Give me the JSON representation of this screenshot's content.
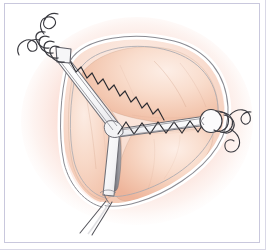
{
  "figure": {
    "title": "Tri-radiate tissue incision with running zigzag suture line",
    "domain_label": "surgical-illustration",
    "background_color": "#ffffff",
    "border_color": "#c9c8dd",
    "shadow_color": "#d9d8e6"
  },
  "palette": {
    "tissue_fill_light": "#fbe3d6",
    "tissue_fill_mid": "#f6cdb8",
    "tissue_fill_deep": "#eeb69c",
    "tissue_glow": "#f4a08a",
    "glow_outer": "#f6b7a4",
    "band_fill": "#ffffff",
    "band_highlight": "#f5f5f7",
    "band_shade": "#e3e3e6",
    "outline": "#6f6f74",
    "outline_soft": "#9a9aa0",
    "suture_thread": "#3a3a40",
    "groove_dark": "#8a8a90",
    "groove_darkest": "#5a5a60"
  },
  "elements": {
    "tissue_mass": {
      "name": "Tissue mass",
      "description": "Rounded triangular organ body, salmon/peach fill with soft red glow at margins"
    },
    "incision": {
      "name": "Tri-radiate incision",
      "arms": 3,
      "arm_labels": [
        "upper-left arm",
        "right arm",
        "lower arm"
      ],
      "center_label": "central junction"
    },
    "suture_line": {
      "name": "Running zigzag suture",
      "stitch_count_upper_left": 11,
      "stitch_count_right": 9,
      "color": "#2c2c31"
    },
    "knot_upper_left": {
      "name": "Upper-left suture knot",
      "loops": 4,
      "tail_count": 2
    },
    "knot_right": {
      "name": "Right suture knot",
      "loops": 3,
      "tail_count": 2
    },
    "tail_bottom": {
      "name": "Inferior tissue stalk",
      "line_count": 2
    }
  }
}
